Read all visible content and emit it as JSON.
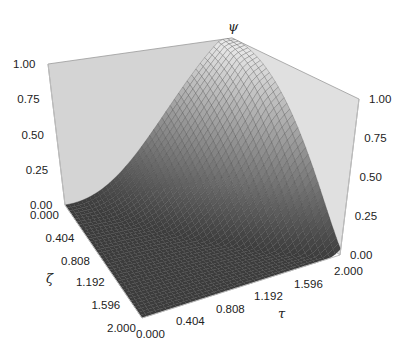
{
  "chart_data": {
    "type": "surface3d",
    "title": "",
    "xlabel": "τ",
    "ylabel": "ζ",
    "zlabel": "ψ",
    "x_ticks": [
      "0.000",
      "0.404",
      "0.808",
      "1.192",
      "1.596",
      "2.000"
    ],
    "y_ticks": [
      "0.000",
      "0.404",
      "0.808",
      "1.192",
      "1.596",
      "2.000"
    ],
    "z_ticks_left": [
      "0.00",
      "0.25",
      "0.50",
      "0.75",
      "1.00"
    ],
    "z_ticks_right": [
      "0.00",
      "0.25",
      "0.50",
      "0.75",
      "1.00"
    ],
    "xlim": [
      0,
      2
    ],
    "ylim": [
      0,
      2
    ],
    "zlim": [
      0,
      1
    ],
    "grid_resolution": 40,
    "surface_description": "psi is 0 across the front half (large zeta / small tau) and rises smoothly to 1.0 at tau=2, zeta=0 (back corner)",
    "colormap": "grayscale, dark at 0, light at 1",
    "wall_color": "#d4d4d4",
    "mesh_color": "#3a3a3a"
  }
}
